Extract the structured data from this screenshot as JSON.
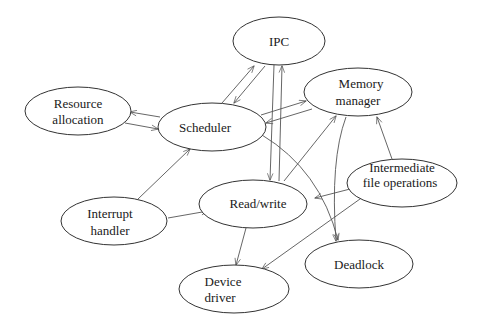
{
  "diagram": {
    "type": "directed-graph",
    "colors": {
      "background": "#ffffff",
      "stroke": "#333333",
      "edge": "#555555",
      "text": "#1a1a1a"
    },
    "nodes": [
      {
        "id": "ipc",
        "lines": [
          "IPC"
        ]
      },
      {
        "id": "resource_allocation",
        "lines": [
          "Resource",
          "allocation"
        ]
      },
      {
        "id": "scheduler",
        "lines": [
          "Scheduler"
        ]
      },
      {
        "id": "memory_manager",
        "lines": [
          "Memory",
          "manager"
        ]
      },
      {
        "id": "intermediate_file_operations",
        "lines": [
          "Intermediate",
          "file operations"
        ]
      },
      {
        "id": "interrupt_handler",
        "lines": [
          "Interrupt",
          "handler"
        ]
      },
      {
        "id": "read_write",
        "lines": [
          "Read/write"
        ]
      },
      {
        "id": "device_driver",
        "lines": [
          "Device",
          "driver"
        ]
      },
      {
        "id": "deadlock",
        "lines": [
          "Deadlock"
        ]
      }
    ],
    "edges": [
      {
        "from": "scheduler",
        "to": "resource_allocation"
      },
      {
        "from": "resource_allocation",
        "to": "scheduler"
      },
      {
        "from": "scheduler",
        "to": "ipc"
      },
      {
        "from": "ipc",
        "to": "scheduler"
      },
      {
        "from": "scheduler",
        "to": "memory_manager"
      },
      {
        "from": "memory_manager",
        "to": "scheduler"
      },
      {
        "from": "interrupt_handler",
        "to": "scheduler"
      },
      {
        "from": "interrupt_handler",
        "to": "read_write"
      },
      {
        "from": "ipc",
        "to": "read_write"
      },
      {
        "from": "read_write",
        "to": "ipc"
      },
      {
        "from": "read_write",
        "to": "memory_manager"
      },
      {
        "from": "scheduler",
        "to": "deadlock"
      },
      {
        "from": "memory_manager",
        "to": "deadlock"
      },
      {
        "from": "intermediate_file_operations",
        "to": "memory_manager"
      },
      {
        "from": "intermediate_file_operations",
        "to": "read_write"
      },
      {
        "from": "intermediate_file_operations",
        "to": "device_driver"
      },
      {
        "from": "read_write",
        "to": "device_driver"
      }
    ]
  }
}
